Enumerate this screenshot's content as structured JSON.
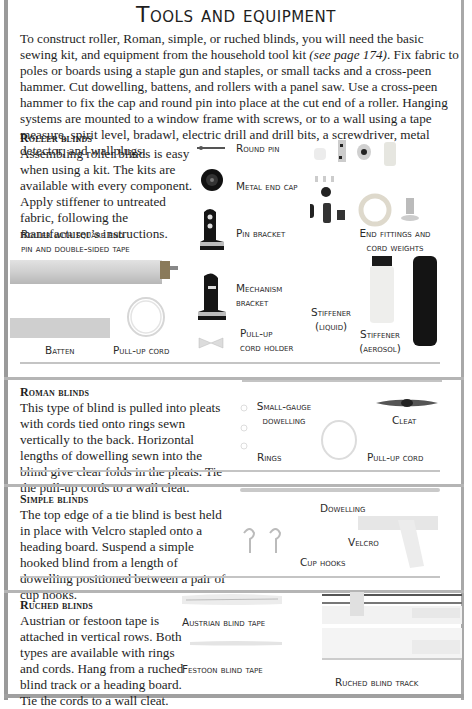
{
  "title": "Tools and equipment",
  "intro": {
    "part1": "To construct roller, Roman, simple, or ruched blinds, you will need the basic sewing kit, and equipment from the household tool kit ",
    "ref": "(see page 174)",
    "part2": ". Fix fabric to poles or boards using a staple gun and staples, or small tacks and a cross-peen hammer. Cut dowelling, battens, and rollers with a panel saw. Use a cross-peen hammer to fix the cap and round pin into place at the cut end of a roller. Hanging systems are mounted to a window frame with screws, or to a wall using a tape measure, spirit level, bradawl, electric drill and drill bits, a screwdriver, metal detector, and wallplugs."
  },
  "sections": {
    "roller": {
      "heading": "Roller blinds",
      "text": "Assembling roller blinds is easy when using a kit. The kits are available with every component. Apply stiffener to untreated fabric, following the manufacturer’s instructions.",
      "labels": {
        "roller_line1": "Roller with square end",
        "roller_line2": "pin and double-sided tape",
        "batten": "Batten",
        "pull_up_cord": "Pull-up cord",
        "round_pin": "Round pin",
        "metal_end_cap": "Metal end cap",
        "pin_bracket": "Pin bracket",
        "mechanism_line1": "Mechanism",
        "mechanism_line2": "bracket",
        "cord_holder_line1": "Pull-up",
        "cord_holder_line2": "cord holder",
        "end_fittings_line1": "End fittings and",
        "end_fittings_line2": "cord weights",
        "stiffener_liquid_line1": "Stiffener",
        "stiffener_liquid_line2": "(liquid)",
        "stiffener_aerosol_line1": "Stiffener",
        "stiffener_aerosol_line2": "(aerosol)"
      }
    },
    "roman": {
      "heading": "Roman blinds",
      "text": "This type of blind is pulled into pleats with cords tied onto rings sewn vertically to the back. Horizontal lengths of dowelling sewn into the blind give clear folds in the pleats. Tie the pull-up cords to a wall cleat.",
      "labels": {
        "dowelling_line1": "Small-gauge",
        "dowelling_line2": "dowelling",
        "rings": "Rings",
        "cleat": "Cleat",
        "pull_up_cord": "Pull-up cord"
      }
    },
    "simple": {
      "heading": "Simple blinds",
      "text": "The top edge of a tie blind is best held in place with Velcro stapled onto a heading board. Suspend a simple hooked blind from a length of dowelling positioned between a pair of cup hooks.",
      "labels": {
        "dowelling": "Dowelling",
        "velcro": "Velcro",
        "cup_hooks": "Cup hooks"
      }
    },
    "ruched": {
      "heading": "Ruched blinds",
      "text": "Austrian or festoon tape is attached in vertical rows. Both types are available with rings and cords. Hang from a ruched blind track or a heading board. Tie the cords to a wall cleat.",
      "labels": {
        "austrian_tape": "Austrian blind tape",
        "festoon_tape": "Festoon blind tape",
        "track": "Ruched blind track"
      }
    }
  },
  "colors": {
    "frame": "#9a9a9a",
    "divider": "#b5b5b5",
    "text": "#1e1e1e"
  }
}
